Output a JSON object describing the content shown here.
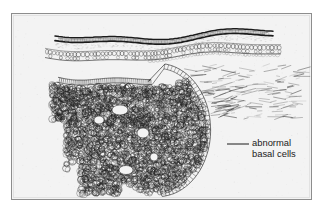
{
  "figure": {
    "kind": "histology-line-drawing",
    "background_color": "#f3f3f3",
    "frame_color": "#8d8d8d",
    "ink_color": "#1b1b1b",
    "page_background": "#ffffff"
  },
  "annotations": [
    {
      "id": "abnormal-basal-cells",
      "line1": "abnormal",
      "line2": "basal cells",
      "leader": {
        "x1": 227,
        "y1": 144,
        "x2": 249,
        "y2": 144
      },
      "text_x": 252,
      "text_y1": 146,
      "text_y2": 157
    }
  ],
  "structures": [
    {
      "name": "stratum-corneum-wavy-band",
      "label": ""
    },
    {
      "name": "epidermis-cell-row",
      "label": ""
    },
    {
      "name": "basal-cell-palisade",
      "label": ""
    },
    {
      "name": "tumor-cell-mass",
      "label": ""
    },
    {
      "name": "dermal-collagen-fibers",
      "label": ""
    }
  ]
}
